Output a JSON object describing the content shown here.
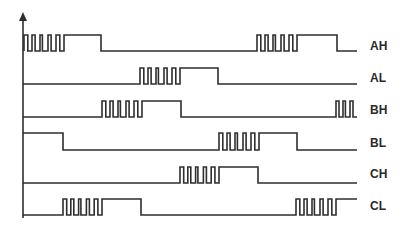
{
  "diagram": {
    "type": "pwm-gate-signal-timing",
    "axis": {
      "x": 23,
      "top": 12,
      "bottom": 218,
      "x_end": 357,
      "arrow": "up-arrow"
    },
    "stroke_color": "#2e2e2e",
    "label_color": "#2a2a2a",
    "background": "#ffffff",
    "signals": [
      {
        "label": "AH",
        "low_y": 51,
        "high_y": 35,
        "label_y": 50,
        "segments": [
          {
            "kind": "pwm",
            "from": 24,
            "to": 64,
            "pulses": 5
          },
          {
            "kind": "high",
            "from": 64,
            "to": 101
          },
          {
            "kind": "low",
            "from": 101,
            "to": 257
          },
          {
            "kind": "pwm",
            "from": 257,
            "to": 297,
            "pulses": 5
          },
          {
            "kind": "high",
            "from": 297,
            "to": 337
          },
          {
            "kind": "low",
            "from": 337,
            "to": 357
          }
        ]
      },
      {
        "label": "AL",
        "low_y": 84,
        "high_y": 68,
        "label_y": 82,
        "segments": [
          {
            "kind": "low",
            "from": 23,
            "to": 140
          },
          {
            "kind": "pwm",
            "from": 140,
            "to": 180,
            "pulses": 5
          },
          {
            "kind": "high",
            "from": 180,
            "to": 218
          },
          {
            "kind": "low",
            "from": 218,
            "to": 357
          }
        ]
      },
      {
        "label": "BH",
        "low_y": 117,
        "high_y": 101,
        "label_y": 114,
        "segments": [
          {
            "kind": "low",
            "from": 23,
            "to": 102
          },
          {
            "kind": "pwm",
            "from": 102,
            "to": 142,
            "pulses": 5
          },
          {
            "kind": "high",
            "from": 142,
            "to": 181
          },
          {
            "kind": "low",
            "from": 181,
            "to": 336
          },
          {
            "kind": "pwm",
            "from": 336,
            "to": 357,
            "pulses": 3
          }
        ]
      },
      {
        "label": "BL",
        "low_y": 150,
        "high_y": 133,
        "label_y": 147,
        "segments": [
          {
            "kind": "high",
            "from": 23,
            "to": 63
          },
          {
            "kind": "low",
            "from": 63,
            "to": 219
          },
          {
            "kind": "pwm",
            "from": 219,
            "to": 259,
            "pulses": 5
          },
          {
            "kind": "high",
            "from": 259,
            "to": 297
          },
          {
            "kind": "low",
            "from": 297,
            "to": 357
          }
        ]
      },
      {
        "label": "CH",
        "low_y": 183,
        "high_y": 167,
        "label_y": 178,
        "segments": [
          {
            "kind": "low",
            "from": 23,
            "to": 180
          },
          {
            "kind": "pwm",
            "from": 180,
            "to": 219,
            "pulses": 5
          },
          {
            "kind": "high",
            "from": 219,
            "to": 258
          },
          {
            "kind": "low",
            "from": 258,
            "to": 357
          }
        ]
      },
      {
        "label": "CL",
        "low_y": 215,
        "high_y": 199,
        "label_y": 210,
        "segments": [
          {
            "kind": "low",
            "from": 23,
            "to": 63
          },
          {
            "kind": "pwm",
            "from": 63,
            "to": 102,
            "pulses": 5
          },
          {
            "kind": "high",
            "from": 102,
            "to": 141
          },
          {
            "kind": "low",
            "from": 141,
            "to": 296
          },
          {
            "kind": "pwm",
            "from": 296,
            "to": 336,
            "pulses": 5
          },
          {
            "kind": "high",
            "from": 336,
            "to": 357
          }
        ]
      }
    ],
    "label_x": 370
  }
}
